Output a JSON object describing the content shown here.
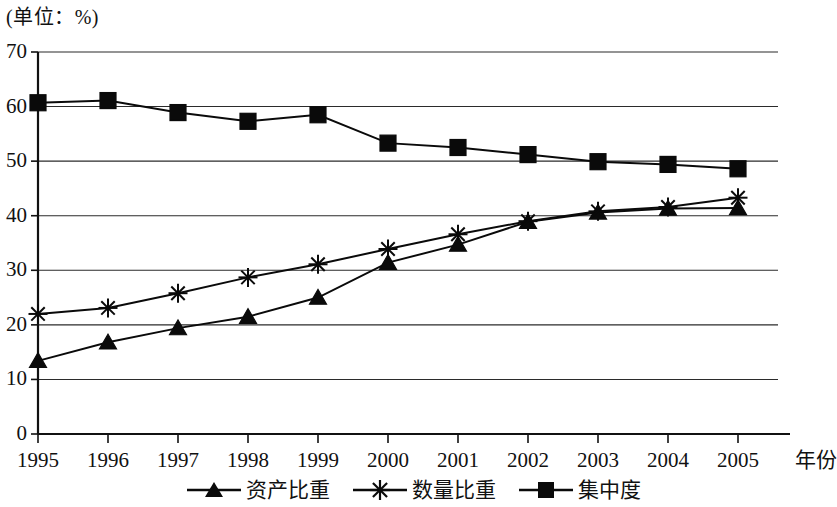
{
  "unit_label": "(单位：%)",
  "axis": {
    "x_name": "年份",
    "y_ticks": [
      "70",
      "60",
      "50",
      "40",
      "30",
      "20",
      "10",
      "0"
    ],
    "x_ticks": [
      "1995",
      "1996",
      "1997",
      "1998",
      "1999",
      "2000",
      "2001",
      "2002",
      "2003",
      "2004",
      "2005"
    ]
  },
  "legend": {
    "items": [
      {
        "label": "资产比重",
        "marker": "triangle-marker"
      },
      {
        "label": "数量比重",
        "marker": "asterisk-marker"
      },
      {
        "label": "集中度",
        "marker": "square-marker"
      }
    ]
  },
  "colors": {
    "line": "#0a0a0a",
    "grid": "#2b2b2b",
    "axis": "#111111",
    "background": "#ffffff"
  },
  "chart_data": {
    "type": "line",
    "title": "",
    "subtitle": "",
    "unit": "%",
    "xlabel": "年份",
    "ylabel": "",
    "x": [
      "1995",
      "1996",
      "1997",
      "1998",
      "1999",
      "2000",
      "2001",
      "2002",
      "2003",
      "2004",
      "2005"
    ],
    "categories": [
      "1995",
      "1996",
      "1997",
      "1998",
      "1999",
      "2000",
      "2001",
      "2002",
      "2003",
      "2004",
      "2005"
    ],
    "ylim": [
      0,
      70
    ],
    "ytick_step": 10,
    "xlim": [
      "1995",
      "2005"
    ],
    "grid": true,
    "grid_axis": "y",
    "legend_position": "bottom",
    "series": [
      {
        "name": "资产比重",
        "marker": "triangle",
        "values": [
          13.4,
          16.8,
          19.4,
          21.5,
          25.0,
          31.4,
          34.7,
          38.9,
          40.6,
          41.3,
          41.4
        ]
      },
      {
        "name": "数量比重",
        "marker": "asterisk",
        "values": [
          22.0,
          23.1,
          25.8,
          28.7,
          31.1,
          33.9,
          36.6,
          39.0,
          40.8,
          41.6,
          43.3
        ]
      },
      {
        "name": "集中度",
        "marker": "square",
        "values": [
          60.7,
          61.1,
          58.9,
          57.3,
          58.5,
          53.3,
          52.5,
          51.2,
          49.9,
          49.4,
          48.6
        ]
      }
    ]
  }
}
